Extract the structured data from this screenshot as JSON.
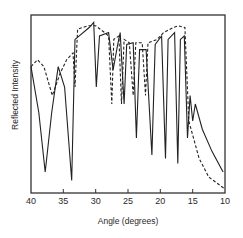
{
  "chart_data": {
    "type": "line",
    "title": "",
    "xlabel": "Angle (degrees)",
    "ylabel": "Reflected Intensity",
    "xlim": [
      40,
      10
    ],
    "x_axis_reversed": true,
    "x_ticks": [
      40,
      35,
      30,
      25,
      20,
      15,
      10
    ],
    "x_tick_labels": [
      "40",
      "35",
      "30",
      "25",
      "20",
      "15",
      "10"
    ],
    "y_ticks": [],
    "grid": false,
    "legend": null,
    "series": [
      {
        "name": "solid",
        "style": "solid",
        "approx_points_angle_vs_relative_intensity": [
          [
            40,
            0.72
          ],
          [
            38.8,
            0.45
          ],
          [
            37.8,
            0.1
          ],
          [
            36.8,
            0.45
          ],
          [
            35.8,
            0.72
          ],
          [
            34.8,
            0.6
          ],
          [
            33.7,
            0.05
          ],
          [
            33.2,
            0.88
          ],
          [
            31,
            0.95
          ],
          [
            30.3,
            0.98
          ],
          [
            29.9,
            0.6
          ],
          [
            29.4,
            0.9
          ],
          [
            28,
            0.92
          ],
          [
            27.3,
            0.7
          ],
          [
            26.6,
            0.85
          ],
          [
            26.2,
            0.92
          ],
          [
            25.6,
            0.5
          ],
          [
            25.2,
            0.85
          ],
          [
            24.2,
            0.86
          ],
          [
            23.7,
            0.3
          ],
          [
            23.2,
            0.82
          ],
          [
            22.2,
            0.82
          ],
          [
            21.3,
            0.2
          ],
          [
            20.8,
            0.85
          ],
          [
            19.8,
            0.9
          ],
          [
            19.2,
            0.18
          ],
          [
            18.8,
            0.88
          ],
          [
            17.8,
            0.92
          ],
          [
            17.3,
            0.15
          ],
          [
            16.9,
            0.88
          ],
          [
            16.3,
            0.9
          ],
          [
            15.8,
            0.3
          ],
          [
            15.4,
            0.55
          ],
          [
            15,
            0.4
          ],
          [
            14.6,
            0.5
          ],
          [
            13.5,
            0.35
          ],
          [
            12,
            0.22
          ],
          [
            10.3,
            0.1
          ]
        ]
      },
      {
        "name": "dashed",
        "style": "dashed",
        "approx_points_angle_vs_relative_intensity": [
          [
            40,
            0.72
          ],
          [
            39,
            0.76
          ],
          [
            38,
            0.72
          ],
          [
            36.7,
            0.55
          ],
          [
            35.5,
            0.68
          ],
          [
            34.5,
            0.76
          ],
          [
            33.5,
            0.8
          ],
          [
            33.2,
            0.6
          ],
          [
            32.8,
            0.94
          ],
          [
            31.2,
            0.96
          ],
          [
            30,
            0.96
          ],
          [
            28.6,
            0.92
          ],
          [
            28,
            0.9
          ],
          [
            27.5,
            0.5
          ],
          [
            27.2,
            0.88
          ],
          [
            26.4,
            0.9
          ],
          [
            26,
            0.5
          ],
          [
            25.6,
            0.88
          ],
          [
            24.8,
            0.86
          ],
          [
            24.2,
            0.55
          ],
          [
            23.8,
            0.86
          ],
          [
            22.8,
            0.86
          ],
          [
            22.3,
            0.55
          ],
          [
            21.9,
            0.86
          ],
          [
            20.5,
            0.88
          ],
          [
            19.5,
            0.92
          ],
          [
            18,
            0.95
          ],
          [
            17.2,
            0.96
          ],
          [
            16.2,
            0.95
          ],
          [
            15.6,
            0.4
          ],
          [
            14,
            0.18
          ],
          [
            12.5,
            0.07
          ],
          [
            10,
            0.0
          ]
        ]
      }
    ]
  }
}
